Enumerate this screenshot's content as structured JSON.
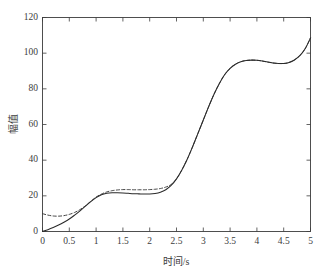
{
  "chart_data": {
    "type": "line",
    "title": "",
    "subtitle": "",
    "xlabel": "时间/s",
    "ylabel": "幅值",
    "xlim": [
      0,
      5
    ],
    "ylim": [
      0,
      120
    ],
    "xticks": [
      "0",
      "0.5",
      "1",
      "1.5",
      "2",
      "2.5",
      "3",
      "3.5",
      "4",
      "4.5",
      "5"
    ],
    "xtick_values": [
      0,
      0.5,
      1,
      1.5,
      2,
      2.5,
      3,
      3.5,
      4,
      4.5,
      5
    ],
    "yticks": [
      "0",
      "20",
      "40",
      "60",
      "80",
      "100",
      "120"
    ],
    "ytick_values": [
      0,
      20,
      40,
      60,
      80,
      100,
      120
    ],
    "grid": false,
    "legend": null,
    "legend_position": "none",
    "box": true,
    "tick_direction": "in",
    "colors": {
      "axis": "#3c3c3c",
      "series_solid": "#2a2a2a",
      "series_dashed": "#3a3a3a",
      "background": "#ffffff"
    },
    "x": [
      0,
      0.1,
      0.2,
      0.3,
      0.4,
      0.5,
      0.6,
      0.7,
      0.8,
      0.9,
      1.0,
      1.1,
      1.2,
      1.3,
      1.4,
      1.5,
      1.6,
      1.7,
      1.8,
      1.9,
      2.0,
      2.1,
      2.2,
      2.3,
      2.4,
      2.5,
      2.6,
      2.7,
      2.8,
      2.9,
      3.0,
      3.1,
      3.2,
      3.3,
      3.4,
      3.5,
      3.6,
      3.7,
      3.8,
      3.9,
      4.0,
      4.1,
      4.2,
      4.3,
      4.4,
      4.5,
      4.6,
      4.7,
      4.8,
      4.9,
      5.0
    ],
    "series": [
      {
        "name": "实线",
        "style": "solid",
        "values": [
          0.0,
          1.0,
          2.2,
          3.6,
          5.2,
          7.0,
          9.2,
          11.6,
          14.2,
          16.8,
          19.0,
          20.6,
          21.4,
          21.7,
          21.7,
          21.6,
          21.4,
          21.2,
          21.1,
          21.0,
          21.0,
          21.3,
          22.0,
          23.4,
          25.8,
          29.5,
          34.5,
          40.5,
          47.5,
          55.0,
          62.5,
          70.0,
          77.0,
          83.0,
          88.0,
          91.5,
          93.8,
          95.2,
          95.9,
          96.1,
          96.0,
          95.6,
          95.0,
          94.5,
          94.2,
          94.2,
          94.8,
          96.2,
          98.6,
          102.5,
          108.5
        ]
      },
      {
        "name": "虚线",
        "style": "dashed",
        "values": [
          10.0,
          9.2,
          8.7,
          8.6,
          8.9,
          9.6,
          10.7,
          12.3,
          14.4,
          16.9,
          19.3,
          21.0,
          22.2,
          22.9,
          23.3,
          23.5,
          23.5,
          23.4,
          23.4,
          23.4,
          23.5,
          23.7,
          24.1,
          24.9,
          26.4,
          29.5,
          34.5,
          40.5,
          47.5,
          55.0,
          62.5,
          70.0,
          77.0,
          83.0,
          88.0,
          91.5,
          93.8,
          95.2,
          95.9,
          96.1,
          96.0,
          95.6,
          95.0,
          94.5,
          94.2,
          94.2,
          94.8,
          96.2,
          98.6,
          102.5,
          108.5
        ]
      }
    ],
    "annotations": []
  }
}
